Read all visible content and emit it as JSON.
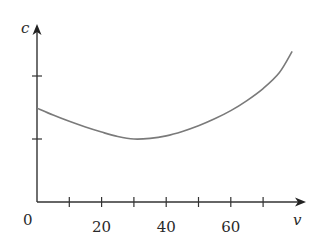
{
  "chart_data": {
    "type": "line",
    "title": "",
    "xlabel": "v",
    "ylabel": "c",
    "origin_label": "0",
    "x_ticks": [
      10,
      20,
      30,
      40,
      50,
      60,
      70
    ],
    "x_tick_labels": [
      {
        "value": 20,
        "label": "20"
      },
      {
        "value": 40,
        "label": "40"
      },
      {
        "value": 60,
        "label": "60"
      }
    ],
    "y_ticks": [
      1,
      2
    ],
    "y_tick_labels": [],
    "xlim": [
      0,
      83
    ],
    "ylim": [
      0,
      2.85
    ],
    "grid": false,
    "legend": null,
    "series": [
      {
        "name": "c(v)",
        "color": "#7a7a7a",
        "x": [
          0,
          5,
          10,
          15,
          20,
          25,
          30,
          35,
          40,
          45,
          50,
          55,
          60,
          65,
          70,
          75,
          79
        ],
        "y": [
          1.49,
          1.38,
          1.28,
          1.19,
          1.11,
          1.04,
          1.0,
          1.01,
          1.05,
          1.12,
          1.21,
          1.32,
          1.45,
          1.61,
          1.8,
          2.05,
          2.39
        ]
      }
    ]
  },
  "colors": {
    "axis": "#333333",
    "curve": "#7a7a7a",
    "text": "#2a2a2a"
  }
}
